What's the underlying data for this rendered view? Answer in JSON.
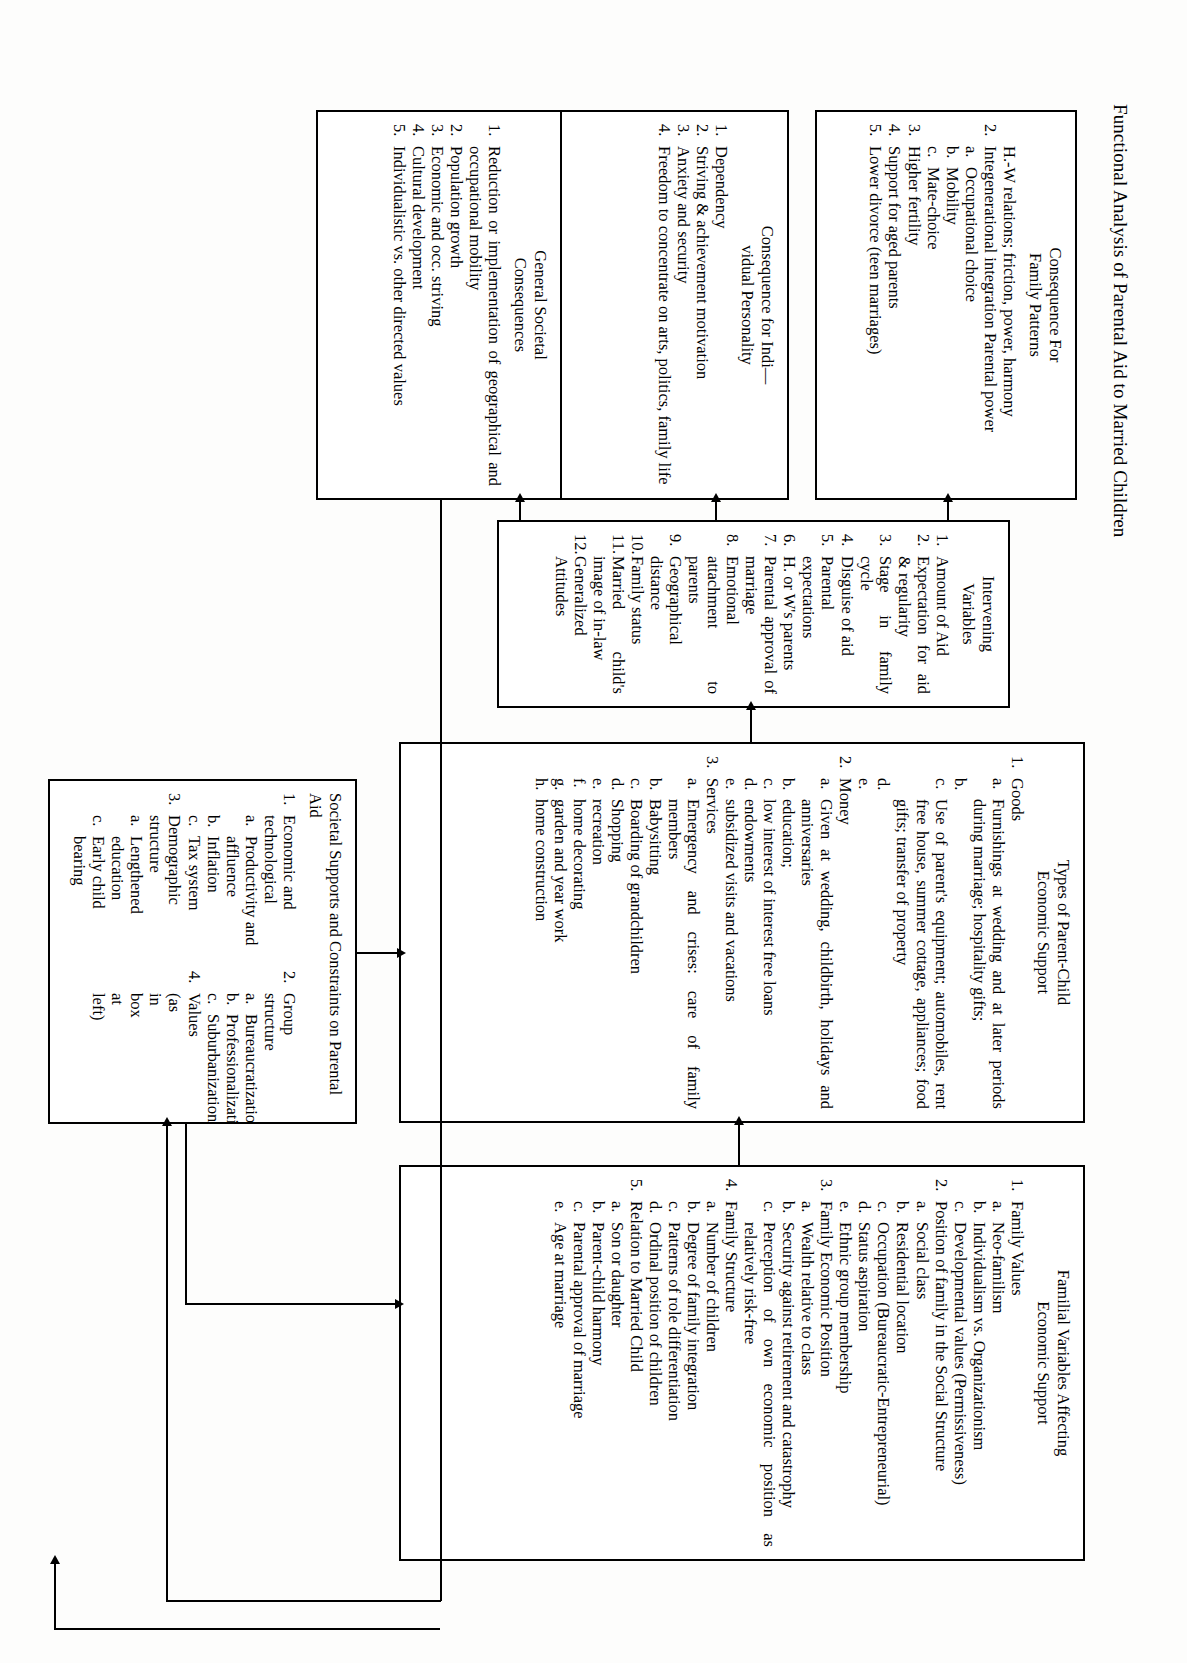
{
  "figure": {
    "title": "Functional Analysis of Parental Aid to Married Children"
  },
  "boxes": {
    "family_patterns": {
      "name": "consequence-for-family-patterns",
      "heading": "Consequence For\nFamily Patterns",
      "items": [
        {
          "marker": "",
          "text": "H.-W relations; friction, power, harmony"
        },
        {
          "marker": "2.",
          "text": "Integenerational integration Parental power",
          "sub": [
            {
              "marker": "a.",
              "text": "Occupational choice"
            },
            {
              "marker": "b.",
              "text": "Mobility"
            },
            {
              "marker": "c.",
              "text": "Mate-choice"
            }
          ]
        },
        {
          "marker": "3.",
          "text": "Higher fertility"
        },
        {
          "marker": "4.",
          "text": "Support for aged parents"
        },
        {
          "marker": "5.",
          "text": "Lower divorce (teen marriages)"
        }
      ]
    },
    "individual": {
      "name": "consequence-for-individual-personality",
      "heading": "Consequence for Indi—\nvidual Personality",
      "items": [
        {
          "marker": "1.",
          "text": "Dependency"
        },
        {
          "marker": "2.",
          "text": "Striving & achievement motivation"
        },
        {
          "marker": "3.",
          "text": "Anxiety and security"
        },
        {
          "marker": "4.",
          "text": "Freedom to concentrate on arts, politics, family life"
        }
      ]
    },
    "societal_consequences": {
      "name": "general-societal-consequences",
      "heading": "General Societal\nConsequences",
      "items": [
        {
          "marker": "1.",
          "text": "Reduction or implementation of geographical and occupational mobility"
        },
        {
          "marker": "2.",
          "text": "Population growth"
        },
        {
          "marker": "3.",
          "text": "Economic and occ. striving"
        },
        {
          "marker": "4.",
          "text": "Cultural development"
        },
        {
          "marker": "5.",
          "text": "Individualistic vs. other directed values"
        }
      ]
    },
    "intervening": {
      "name": "intervening-variables",
      "heading": "Intervening\nVariables",
      "items": [
        {
          "marker": "1.",
          "text": "Amount of Aid"
        },
        {
          "marker": "2.",
          "text": "Expectation for aid & regularity"
        },
        {
          "marker": "3.",
          "text": "Stage in family cycle"
        },
        {
          "marker": "4.",
          "text": "Disguise of aid"
        },
        {
          "marker": "5.",
          "text": "Parental expectations"
        },
        {
          "marker": "6.",
          "text": "H. or W's parents"
        },
        {
          "marker": "7.",
          "text": "Parental approval of marriage"
        },
        {
          "marker": "8.",
          "text": "Emotional attachment to parents"
        },
        {
          "marker": "9.",
          "text": "Geographical distance"
        },
        {
          "marker": "10.",
          "text": "Family status"
        },
        {
          "marker": "11.",
          "text": "Married child's image of in-law"
        },
        {
          "marker": "12.",
          "text": "Generalized Attitudes"
        }
      ]
    },
    "types": {
      "name": "types-of-parent-child-economic-support",
      "heading": "Types of Parent-Child\nEconomic Support",
      "items": [
        {
          "marker": "1.",
          "text": "Goods",
          "sub": [
            {
              "marker": "a.",
              "text": "Furnishings at wedding and at later periods during marriage; hospitality gifts;"
            },
            {
              "marker": "b.",
              "text": ""
            },
            {
              "marker": "c.",
              "text": "Use of parent's equipment; automobiles, rent free house, summer cottage, appliances; food gifts; transfer of property"
            },
            {
              "marker": "d.",
              "text": ""
            },
            {
              "marker": "e.",
              "text": ""
            }
          ]
        },
        {
          "marker": "2.",
          "text": "Money",
          "sub": [
            {
              "marker": "a.",
              "text": "Given at wedding, childbirth, holidays and anniversaries"
            },
            {
              "marker": "b.",
              "text": "education;"
            },
            {
              "marker": "c.",
              "text": "low interest of interest free loans"
            },
            {
              "marker": "d.",
              "text": "endowments"
            },
            {
              "marker": "e.",
              "text": "subsidized visits and vacations"
            }
          ]
        },
        {
          "marker": "3.",
          "text": "Services",
          "sub": [
            {
              "marker": "a.",
              "text": "Emergency and crises: care of family members"
            },
            {
              "marker": "b.",
              "text": "Babysitting"
            },
            {
              "marker": "c.",
              "text": "Boarding of grandchildren"
            },
            {
              "marker": "d.",
              "text": "Shopping"
            },
            {
              "marker": "e.",
              "text": "recreation"
            },
            {
              "marker": "f.",
              "text": "home decorating"
            },
            {
              "marker": "g.",
              "text": "garden and year work"
            },
            {
              "marker": "h.",
              "text": "home construction"
            }
          ]
        }
      ]
    },
    "supports": {
      "name": "societal-supports-and-constraints-on-parental-aid",
      "heading": "Societal Supports and Constraints on Parental Aid",
      "col_left": [
        {
          "marker": "1.",
          "text": "Economic and technological",
          "sub": [
            {
              "marker": "a.",
              "text": "Productivity and affluence"
            },
            {
              "marker": "b.",
              "text": "Inflation"
            },
            {
              "marker": "c.",
              "text": "Tax system"
            }
          ]
        },
        {
          "marker": "3.",
          "text": "Demographic structure",
          "sub": [
            {
              "marker": "a.",
              "text": "Lengthened education"
            },
            {
              "marker": "c.",
              "text": "Early child bearing"
            }
          ]
        }
      ],
      "col_mid": [
        {
          "marker": "2.",
          "text": "Group structure",
          "sub": [
            {
              "marker": "a.",
              "text": "Bureaucratization"
            },
            {
              "marker": "b.",
              "text": "Professionalization"
            },
            {
              "marker": "c.",
              "text": "Suburbanization"
            }
          ]
        },
        {
          "marker": "4.",
          "text": "Values (as in box at left)"
        }
      ],
      "col_right": [
        {
          "marker": "b.",
          "text": "Early age at marriage"
        },
        {
          "marker": "d.",
          "text": "Lengthened life span"
        }
      ]
    },
    "familial": {
      "name": "familial-variables-affecting-economic-support",
      "heading": "Familial Variables Affecting\nEconomic Support",
      "items": [
        {
          "marker": "1.",
          "text": "Family Values",
          "sub": [
            {
              "marker": "a.",
              "text": "Neo-familism"
            },
            {
              "marker": "b.",
              "text": "Individualism vs. Organizationism"
            },
            {
              "marker": "c.",
              "text": "Developmental values (Permissiveness)"
            }
          ]
        },
        {
          "marker": "2.",
          "text": "Position of family in the Social Structure",
          "sub": [
            {
              "marker": "a.",
              "text": "Social class"
            },
            {
              "marker": "b.",
              "text": "Residential location"
            },
            {
              "marker": "c.",
              "text": "Occupation (Bureaucratic-Entrepreneurial)"
            },
            {
              "marker": "d.",
              "text": "Status aspiration"
            },
            {
              "marker": "e.",
              "text": "Ethnic group membership"
            }
          ]
        },
        {
          "marker": "3.",
          "text": "Family Economic Position",
          "sub": [
            {
              "marker": "a.",
              "text": "Wealth relative to class"
            },
            {
              "marker": "b.",
              "text": "Security against retirement and catastrophy"
            },
            {
              "marker": "c.",
              "text": "Perception of own economic position as relatively risk-free"
            }
          ]
        },
        {
          "marker": "4.",
          "text": "Family Structure",
          "sub": [
            {
              "marker": "a.",
              "text": "Number of children"
            },
            {
              "marker": "b.",
              "text": "Degree of family integration"
            },
            {
              "marker": "c.",
              "text": "Patterns of role differentiation"
            },
            {
              "marker": "d.",
              "text": "Ordinal position of children"
            }
          ]
        },
        {
          "marker": "5.",
          "text": "Relation to Married Child",
          "sub": [
            {
              "marker": "a.",
              "text": "Son or daughter"
            },
            {
              "marker": "b.",
              "text": "Parent-child harmony"
            },
            {
              "marker": "c.",
              "text": "Parental approval of marriage"
            },
            {
              "marker": "e.",
              "text": "Age at marriage"
            }
          ]
        }
      ]
    }
  }
}
